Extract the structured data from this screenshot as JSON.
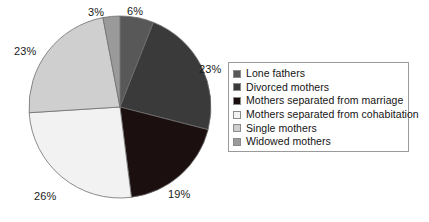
{
  "chart_data": {
    "type": "pie",
    "title": "",
    "subtitle": "",
    "xlabel": "",
    "ylabel": "",
    "legend_position": "right",
    "grid": false,
    "units": "percent",
    "total": 100,
    "start_angle_deg": 0,
    "direction": "clockwise",
    "categories": [
      "Lone fathers",
      "Divorced mothers",
      "Mothers separated from marriage",
      "Mothers separated from cohabitation",
      "Single mothers",
      "Widowed mothers"
    ],
    "values": [
      6,
      23,
      19,
      26,
      23,
      3
    ],
    "data_labels": [
      "6%",
      "23%",
      "19%",
      "26%",
      "23%",
      "3%"
    ],
    "colors": [
      "#585858",
      "#3a3a3a",
      "#1c0f0f",
      "#f2f2f2",
      "#cfcfcf",
      "#9a9a9a"
    ],
    "slices": [
      {
        "label": "Lone fathers",
        "value": 6,
        "data_label": "6%",
        "color": "#585858"
      },
      {
        "label": "Divorced mothers",
        "value": 23,
        "data_label": "23%",
        "color": "#3a3a3a"
      },
      {
        "label": "Mothers separated from marriage",
        "value": 19,
        "data_label": "19%",
        "color": "#1c0f0f"
      },
      {
        "label": "Mothers separated from cohabitation",
        "value": 26,
        "data_label": "26%",
        "color": "#f2f2f2"
      },
      {
        "label": "Single mothers",
        "value": 23,
        "data_label": "23%",
        "color": "#cfcfcf"
      },
      {
        "label": "Widowed mothers",
        "value": 3,
        "data_label": "3%",
        "color": "#9a9a9a"
      }
    ]
  },
  "labels": {
    "top_left": "3%",
    "top_right": "6%",
    "right": "23%",
    "bottom_right": "19%",
    "bottom_left": "26%",
    "left": "23%"
  },
  "legend": {
    "items": [
      {
        "label": "Lone fathers",
        "color": "#585858"
      },
      {
        "label": "Divorced mothers",
        "color": "#3a3a3a"
      },
      {
        "label": "Mothers separated from marriage",
        "color": "#1c0f0f"
      },
      {
        "label": "Mothers separated from cohabitation",
        "color": "#f2f2f2"
      },
      {
        "label": "Single mothers",
        "color": "#cfcfcf"
      },
      {
        "label": "Widowed mothers",
        "color": "#9a9a9a"
      }
    ]
  }
}
